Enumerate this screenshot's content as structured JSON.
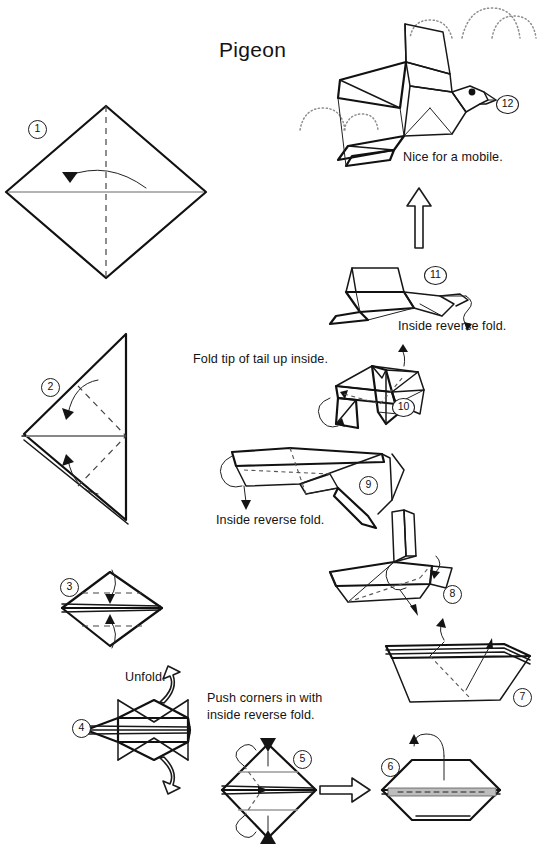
{
  "document": {
    "title": "Pigeon",
    "type": "origami-instruction-diagram",
    "model_name": "Pigeon",
    "total_steps": 12,
    "page_background": "#ffffff",
    "ink_color": "#171717"
  },
  "steps": [
    {
      "number": "1",
      "badge": "1",
      "caption": "",
      "note": "square rotated 45 degrees, vertical dashed valley fold, horizontal gray crease, curved arrow pointing left"
    },
    {
      "number": "2",
      "badge": "2",
      "caption": "",
      "note": "folded triangle with two dashed diagonal fold lines and two curved arrows"
    },
    {
      "number": "3",
      "badge": "3",
      "caption": "Unfold.",
      "note": "diamond with two horizontal dashed lines and two vertical arrows"
    },
    {
      "number": "4",
      "badge": "4",
      "caption": "",
      "note": "hexagon with two hollow curved push arrows top and bottom"
    },
    {
      "number": "5",
      "badge": "5",
      "caption": "Push corners in with\ninside reverse fold.",
      "note": "diamond with dotted interior fold lines and solid push arrowheads"
    },
    {
      "number": "6",
      "badge": "6",
      "caption": "",
      "note": "hexagon with fold-over arrow at top"
    },
    {
      "number": "7",
      "badge": "7",
      "caption": "",
      "note": "boat shape with dashed fold lines and two thin arrows"
    },
    {
      "number": "8",
      "badge": "8",
      "caption": "",
      "note": "bird base with raised flaps and curved arrows"
    },
    {
      "number": "9",
      "badge": "9",
      "caption": "Inside reverse fold.",
      "note": "angled form with downward arrow"
    },
    {
      "number": "10",
      "badge": "10",
      "caption": "Fold tip of tail up inside.",
      "note": "form with tail and arrows"
    },
    {
      "number": "11",
      "badge": "11",
      "caption": "Inside reverse fold.",
      "note": "near-complete pigeon with head arrow"
    },
    {
      "number": "12",
      "badge": "12",
      "caption": "Nice for a mobile.",
      "note": "finished pigeon with dotted clouds"
    }
  ],
  "captions": {
    "unfold": "Unfold.",
    "push_corners_line1": "Push corners in with",
    "push_corners_line2": "inside reverse fold.",
    "inside_reverse_fold_9": "Inside reverse fold.",
    "fold_tip_of_tail": "Fold tip of tail up inside.",
    "inside_reverse_fold_11": "Inside reverse fold.",
    "nice_for_a_mobile": "Nice for a mobile."
  },
  "badges": {
    "s1": "1",
    "s2": "2",
    "s3": "3",
    "s4": "4",
    "s5": "5",
    "s6": "6",
    "s7": "7",
    "s8": "8",
    "s9": "9",
    "s10": "10",
    "s11": "11",
    "s12": "12"
  },
  "decorations": {
    "cloud_right": "dotted-cloud",
    "cloud_left": "dotted-cloud",
    "transition_arrow_up": "hollow-up-arrow",
    "transition_arrow_right": "hollow-right-arrow"
  }
}
